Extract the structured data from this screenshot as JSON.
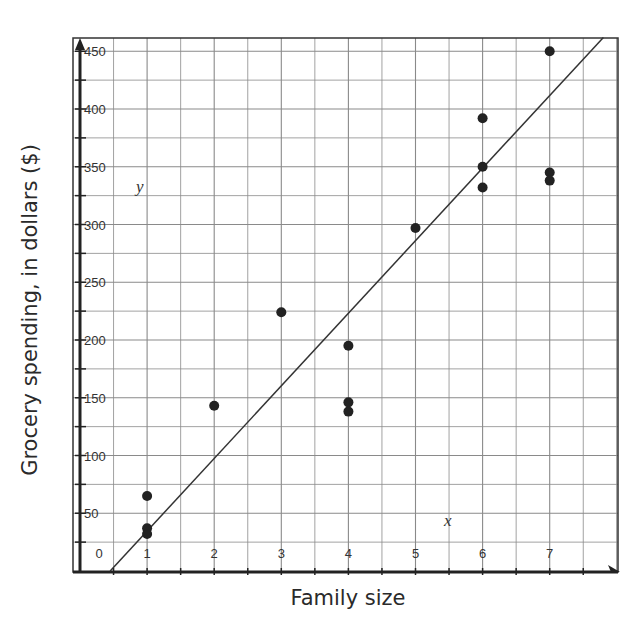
{
  "chart_data": {
    "type": "scatter",
    "title": "",
    "xlabel": "Family size",
    "ylabel": "Grocery spending, in dollars ($)",
    "x_axis_variable": "x",
    "y_axis_variable": "y",
    "xlim": [
      0,
      8
    ],
    "ylim": [
      0,
      460
    ],
    "x_ticks": [
      0,
      1,
      2,
      3,
      4,
      5,
      6,
      7
    ],
    "x_tick_labels": [
      "0",
      "1",
      "2",
      "3",
      "4",
      "5",
      "6",
      "7"
    ],
    "y_ticks": [
      50,
      100,
      150,
      200,
      250,
      300,
      350,
      400,
      450
    ],
    "y_tick_labels": [
      "50",
      "100",
      "150",
      "200",
      "250",
      "300",
      "350",
      "400",
      "450"
    ],
    "grid": true,
    "grid_x_step": 0.5,
    "grid_y_step": 25,
    "legend": null,
    "points": [
      {
        "x": 1,
        "y": 65
      },
      {
        "x": 1,
        "y": 37
      },
      {
        "x": 1,
        "y": 32
      },
      {
        "x": 2,
        "y": 143
      },
      {
        "x": 3,
        "y": 224
      },
      {
        "x": 4,
        "y": 195
      },
      {
        "x": 4,
        "y": 146
      },
      {
        "x": 4,
        "y": 138
      },
      {
        "x": 5,
        "y": 297
      },
      {
        "x": 6,
        "y": 392
      },
      {
        "x": 6,
        "y": 350
      },
      {
        "x": 6,
        "y": 332
      },
      {
        "x": 7,
        "y": 450
      },
      {
        "x": 7,
        "y": 345
      },
      {
        "x": 7,
        "y": 338
      }
    ],
    "trend_line": {
      "type": "line of best fit",
      "start": {
        "x": 0.45,
        "y": 0
      },
      "end": {
        "x": 7.8,
        "y": 462
      }
    }
  },
  "colors": {
    "points": "#222222",
    "grid": "#8a8a8a",
    "axis": "#222222",
    "line": "#333333"
  }
}
